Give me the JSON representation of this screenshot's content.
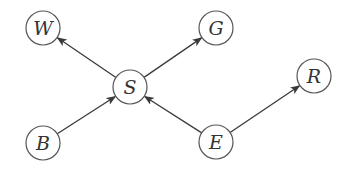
{
  "diagram": {
    "type": "directed-graph",
    "node_radius": 17,
    "colors": {
      "stroke": "#555555",
      "edge": "#3a3a3a",
      "label": "#333333",
      "background": "#ffffff"
    },
    "nodes": [
      {
        "id": "W",
        "label": "W",
        "x": 43,
        "y": 28
      },
      {
        "id": "G",
        "label": "G",
        "x": 216,
        "y": 28
      },
      {
        "id": "S",
        "label": "S",
        "x": 130,
        "y": 87
      },
      {
        "id": "R",
        "label": "R",
        "x": 314,
        "y": 76
      },
      {
        "id": "B",
        "label": "B",
        "x": 43,
        "y": 143
      },
      {
        "id": "E",
        "label": "E",
        "x": 216,
        "y": 142
      }
    ],
    "edges": [
      {
        "from": "S",
        "to": "W"
      },
      {
        "from": "S",
        "to": "G"
      },
      {
        "from": "B",
        "to": "S"
      },
      {
        "from": "E",
        "to": "S"
      },
      {
        "from": "E",
        "to": "R"
      }
    ]
  }
}
